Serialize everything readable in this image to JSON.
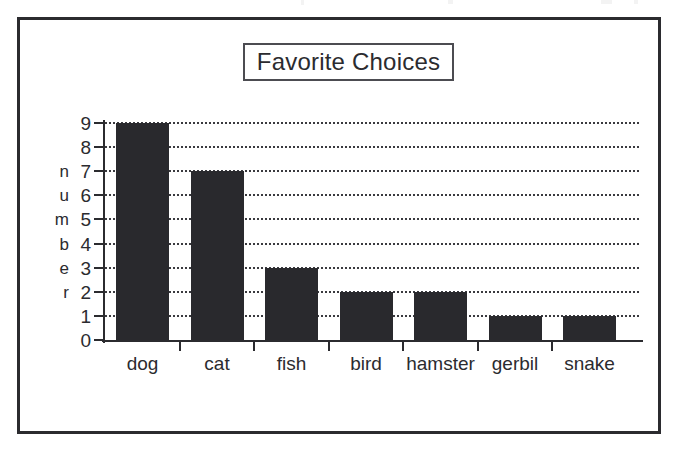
{
  "frame": {
    "border_color": "#2b2b2f",
    "background": "#ffffff"
  },
  "title": {
    "text": "Favorite Choices",
    "boxed": true,
    "box_border_color": "#4c4c51"
  },
  "axis_title": {
    "y_vertical_letters": [
      "n",
      "u",
      "m",
      "b",
      "e",
      "r"
    ],
    "y_vertical_text": "number"
  },
  "chart_data": {
    "type": "bar",
    "title": "Favorite Choices",
    "xlabel": "",
    "ylabel": "number",
    "categories": [
      "dog",
      "cat",
      "fish",
      "bird",
      "hamster",
      "gerbil",
      "snake"
    ],
    "values": [
      9,
      7,
      3,
      2,
      2,
      1,
      1
    ],
    "ylim": [
      0,
      9
    ],
    "yticks": [
      0,
      1,
      2,
      3,
      4,
      5,
      6,
      7,
      8,
      9
    ],
    "ytick_labels": [
      "0",
      "1",
      "2",
      "3",
      "4",
      "5",
      "6",
      "7",
      "8",
      "9"
    ],
    "grid": true,
    "grid_style": "dotted",
    "grid_axis": "y",
    "legend": false,
    "bar_color": "#29292d",
    "axis_color": "#2b2b2f",
    "background": "#ffffff"
  }
}
